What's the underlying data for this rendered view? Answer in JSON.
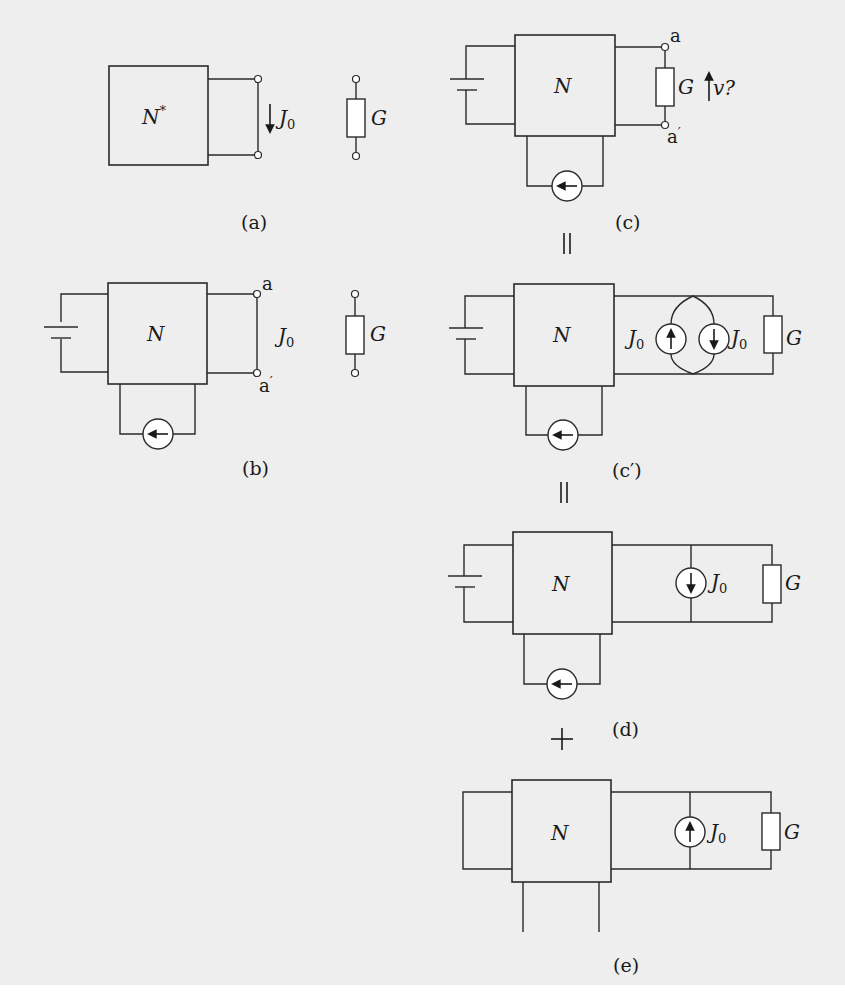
{
  "figure": {
    "background": "#eeeeee",
    "line_color": "#2a2a2a"
  },
  "panels": {
    "a": {
      "caption": "(a)",
      "network_label": "N",
      "network_sup": "*",
      "current_label": "J",
      "current_sub": "0",
      "resistor_label": "G"
    },
    "b": {
      "caption": "(b)",
      "network_label": "N",
      "terminal_top": "a",
      "terminal_bottom": "a",
      "terminal_bottom_prime": "′",
      "current_label": "J",
      "current_sub": "0",
      "resistor_label": "G"
    },
    "c": {
      "caption": "(c)",
      "network_label": "N",
      "terminal_top": "a",
      "terminal_bottom": "a",
      "terminal_bottom_prime": "′",
      "resistor_label": "G",
      "voltage_label": "v?"
    },
    "c_prime": {
      "caption": "(c′)",
      "network_label": "N",
      "source_left_label": "J",
      "source_left_sub": "0",
      "source_right_label": "J",
      "source_right_sub": "0",
      "resistor_label": "G"
    },
    "d": {
      "caption": "(d)",
      "network_label": "N",
      "source_label": "J",
      "source_sub": "0",
      "resistor_label": "G"
    },
    "e": {
      "caption": "(e)",
      "network_label": "N",
      "source_label": "J",
      "source_sub": "0",
      "resistor_label": "G"
    }
  },
  "operators": {
    "equals_1": "=",
    "equals_2": "=",
    "plus": "+"
  }
}
